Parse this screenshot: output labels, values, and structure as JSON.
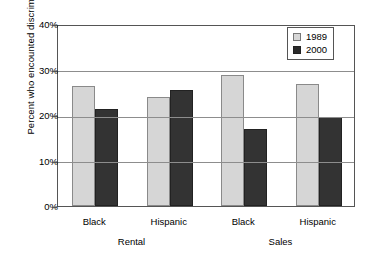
{
  "chart_data": {
    "type": "bar",
    "title": "",
    "xlabel": "",
    "ylabel": "Percent who encounted discrimination",
    "ylim": [
      0,
      40
    ],
    "ytick_labels": [
      "40%",
      "30%",
      "20%",
      "10%",
      "0%"
    ],
    "ytick_values": [
      40,
      30,
      20,
      10,
      0
    ],
    "grid": true,
    "legend_position": "top-right",
    "categories": [
      "Black",
      "Hispanic",
      "Black",
      "Hispanic"
    ],
    "groups": [
      {
        "name": "Rental",
        "categories": [
          "Black",
          "Hispanic"
        ]
      },
      {
        "name": "Sales",
        "categories": [
          "Black",
          "Hispanic"
        ]
      }
    ],
    "series": [
      {
        "name": "1989",
        "color": "#d6d6d6",
        "values": [
          26.3,
          24.0,
          28.8,
          26.8
        ]
      },
      {
        "name": "2000",
        "color": "#333333",
        "values": [
          21.4,
          25.5,
          17.0,
          19.6
        ]
      }
    ]
  }
}
